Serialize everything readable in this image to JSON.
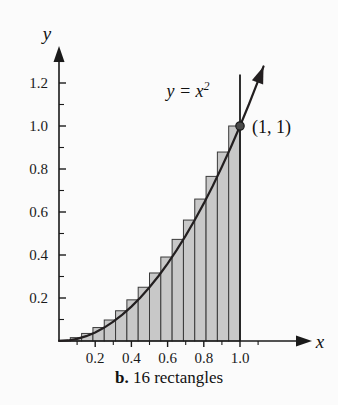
{
  "figure": {
    "caption_letter": "b.",
    "caption_text": "16 rectangles",
    "background_color": "#fbfbfb"
  },
  "axes": {
    "x_axis_name": "x",
    "y_axis_name": "y",
    "x_tick_labels": [
      "0.2",
      "0.4",
      "0.6",
      "0.8",
      "1.0"
    ],
    "y_tick_labels": [
      "0.2",
      "0.4",
      "0.6",
      "0.8",
      "1.0",
      "1.2"
    ]
  },
  "annotations": {
    "curve_label_base": "y = x",
    "curve_label_exponent": "2",
    "point_label": "(1, 1)"
  },
  "chart_data": {
    "type": "area",
    "title": "b. 16 rectangles",
    "subtitle": "",
    "xlabel": "x",
    "ylabel": "y",
    "xlim": [
      0,
      1.24
    ],
    "ylim": [
      0,
      1.3
    ],
    "grid": false,
    "legend_position": "none",
    "curve": {
      "name": "y = x^2",
      "equation": "y = x^2",
      "color": "#231f20",
      "x_domain": [
        0,
        1.13
      ],
      "points_x": [
        0,
        0.05,
        0.1,
        0.15,
        0.2,
        0.25,
        0.3,
        0.35,
        0.4,
        0.45,
        0.5,
        0.55,
        0.6,
        0.65,
        0.7,
        0.75,
        0.8,
        0.85,
        0.9,
        0.95,
        1.0,
        1.05,
        1.1,
        1.13
      ],
      "points_y": [
        0,
        0.0025,
        0.01,
        0.0225,
        0.04,
        0.0625,
        0.09,
        0.1225,
        0.16,
        0.2025,
        0.25,
        0.3025,
        0.36,
        0.4225,
        0.49,
        0.5625,
        0.64,
        0.7225,
        0.81,
        0.9025,
        1.0,
        1.1025,
        1.21,
        1.2769
      ]
    },
    "rectangles": {
      "count": 16,
      "rule": "right-endpoint",
      "interval": [
        0,
        1
      ],
      "width": 0.0625,
      "fill_color": "#c8c8c8",
      "edge_color": "#3a3a3a",
      "left_edges": [
        0,
        0.0625,
        0.125,
        0.1875,
        0.25,
        0.3125,
        0.375,
        0.4375,
        0.5,
        0.5625,
        0.625,
        0.6875,
        0.75,
        0.8125,
        0.875,
        0.9375
      ],
      "right_edges": [
        0.0625,
        0.125,
        0.1875,
        0.25,
        0.3125,
        0.375,
        0.4375,
        0.5,
        0.5625,
        0.625,
        0.6875,
        0.75,
        0.8125,
        0.875,
        0.9375,
        1.0
      ],
      "heights": [
        0.00390625,
        0.015625,
        0.03515625,
        0.0625,
        0.09765625,
        0.140625,
        0.19140625,
        0.25,
        0.31640625,
        0.390625,
        0.47265625,
        0.5625,
        0.66015625,
        0.765625,
        0.87890625,
        1.0
      ],
      "riemann_sum": 0.3652
    },
    "marked_point": {
      "label": "(1, 1)",
      "x": 1,
      "y": 1
    },
    "vertical_line": {
      "x": 1,
      "y_from": 0,
      "y_to": 1.24
    },
    "x_ticks_major": [
      0.2,
      0.4,
      0.6,
      0.8,
      1.0
    ],
    "x_ticks_minor": [
      0.1,
      0.3,
      0.5,
      0.7,
      0.9,
      1.1
    ],
    "y_ticks_major": [
      0.2,
      0.4,
      0.6,
      0.8,
      1.0,
      1.2
    ],
    "y_ticks_minor": [
      0.1,
      0.3,
      0.5,
      0.7,
      0.9,
      1.1,
      1.3
    ]
  }
}
